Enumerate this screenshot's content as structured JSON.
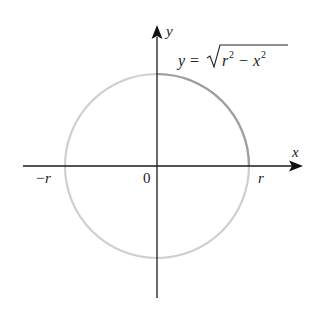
{
  "diagram": {
    "type": "circle-on-axes",
    "equation": {
      "lhs": "y",
      "eq": "=",
      "radicand_r": "r",
      "radicand_exp1": "2",
      "minus": "−",
      "radicand_x": "x",
      "radicand_exp2": "2"
    },
    "axes": {
      "x_label": "x",
      "y_label": "y"
    },
    "tick_labels": {
      "neg_r": "−r",
      "origin": "0",
      "pos_r": "r"
    },
    "colors": {
      "axis": "#1a1a1a",
      "circle": "#c8c8c8",
      "highlight_arc": "#9a9a9a",
      "text": "#222222"
    }
  }
}
